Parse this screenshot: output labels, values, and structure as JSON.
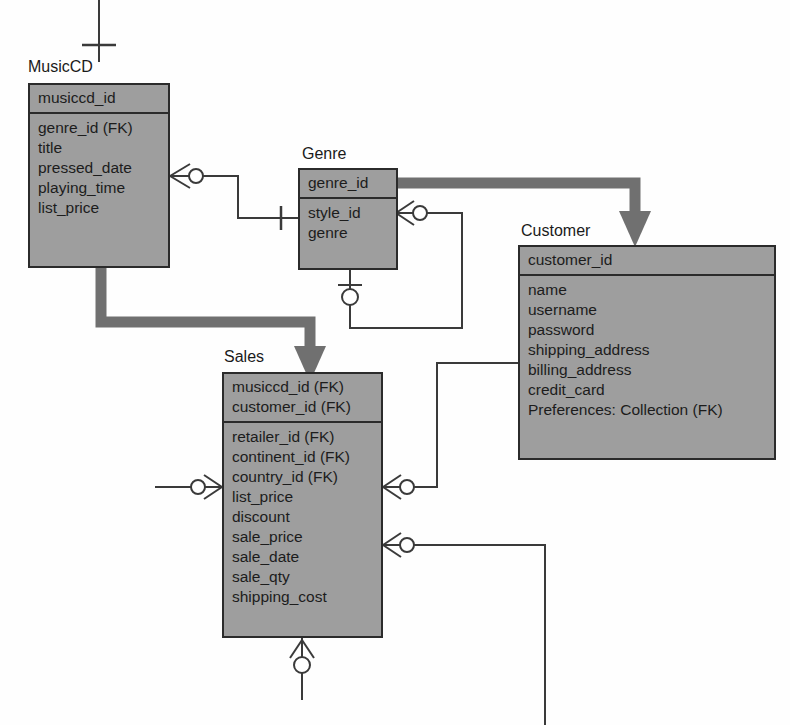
{
  "diagram": {
    "notation": "crow's foot (IDEF1X style)",
    "fill_color": "#9e9e9e",
    "line_color": "#2b2b2b",
    "arrow_color": "#707070",
    "background": "#ffffff"
  },
  "entities": [
    {
      "id": "musiccd",
      "name": "MusicCD",
      "primary_keys": [
        "musiccd_id"
      ],
      "attributes": [
        "genre_id (FK)",
        "title",
        "pressed_date",
        "playing_time",
        "list_price"
      ]
    },
    {
      "id": "genre",
      "name": "Genre",
      "primary_keys": [
        "genre_id"
      ],
      "attributes": [
        "style_id",
        "genre"
      ]
    },
    {
      "id": "customer",
      "name": "Customer",
      "primary_keys": [
        "customer_id"
      ],
      "attributes": [
        "name",
        "username",
        "password",
        "shipping_address",
        "billing_address",
        "credit_card",
        "Preferences: Collection (FK)"
      ]
    },
    {
      "id": "sales",
      "name": "Sales",
      "primary_keys": [
        "musiccd_id (FK)",
        "customer_id (FK)"
      ],
      "attributes": [
        "retailer_id (FK)",
        "continent_id (FK)",
        "country_id (FK)",
        "list_price",
        "discount",
        "sale_price",
        "sale_date",
        "sale_qty",
        "shipping_cost"
      ]
    }
  ],
  "relationships": [
    {
      "from": "musiccd",
      "to": "genre",
      "from_cardinality": "zero-or-many",
      "to_cardinality": "one"
    },
    {
      "from": "genre",
      "to": "genre",
      "from_cardinality": "zero-or-many",
      "to_cardinality": "zero-or-one"
    },
    {
      "from": "genre",
      "to": "customer",
      "type": "identifying-arrow"
    },
    {
      "from": "musiccd",
      "to": "sales",
      "type": "identifying-arrow"
    },
    {
      "from": "sales",
      "to": "customer",
      "from_cardinality": "zero-or-many",
      "to_cardinality": "one"
    },
    {
      "from": "sales",
      "to": "external-right",
      "from_cardinality": "zero-or-many"
    },
    {
      "from": "external-left",
      "to": "sales",
      "to_cardinality": "zero-or-many"
    },
    {
      "from": "sales",
      "to": "external-below",
      "from_cardinality": "zero-or-many"
    },
    {
      "from": "external-above",
      "to": "musiccd",
      "to_cardinality": "one"
    }
  ]
}
